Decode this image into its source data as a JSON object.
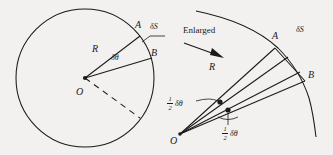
{
  "figure": {
    "background_color": "#f2f1ef",
    "stroke_color": "#1b1b1b",
    "left_panel": {
      "name": "circle-diagram",
      "center_label": "O",
      "radius_label": "R",
      "angle_label": "δθ",
      "point_labels": [
        "A",
        "B"
      ],
      "arc_label": "δS",
      "dashed_line": true
    },
    "transition": {
      "label": "Enlarged",
      "arrow": "right-arrow"
    },
    "right_panel": {
      "name": "enlarged-sector-diagram",
      "vertex_label": "O",
      "radius_label": "R",
      "point_labels": [
        "A",
        "B"
      ],
      "arc_label": "δS",
      "half_angle_numerator": "1",
      "half_angle_denominator": "2",
      "half_angle_symbol": "δθ",
      "angle_marker_count": 2
    }
  }
}
